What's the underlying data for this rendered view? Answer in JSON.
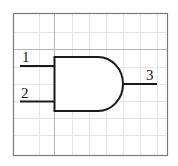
{
  "diagram": {
    "type": "logic-gate",
    "gate": "AND",
    "inputs": [
      {
        "label": "1"
      },
      {
        "label": "2"
      }
    ],
    "output": {
      "label": "3"
    },
    "grid": {
      "visible": true,
      "spacing_px": 17
    },
    "colors": {
      "background": "#ffffff",
      "border": "#7a7a7a",
      "major_grid": "#b0b0b0",
      "minor_grid": "#e4e4e4",
      "stroke": "#1a1a1a"
    }
  }
}
